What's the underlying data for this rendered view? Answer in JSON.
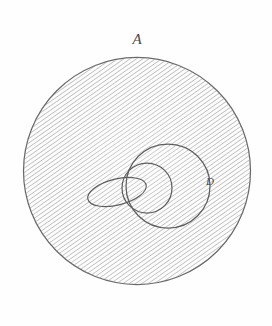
{
  "figure": {
    "background_color": "#fefefe",
    "ink_color": "#5a5a5a",
    "hatch_color": "#9a9a9a",
    "labels": {
      "outer_circle_label": "A",
      "inner_loop_label": "D"
    },
    "outer_circle": {
      "name": "outer-circle",
      "center_x": 137,
      "center_y": 171,
      "radius": 114,
      "fill": "hatched",
      "hatch_angle_deg": 55,
      "hatch_spacing_px": 3
    },
    "shapes": [
      {
        "name": "large-loop",
        "type": "circle",
        "center_x": 168,
        "center_y": 186,
        "radius": 42
      },
      {
        "name": "small-circle",
        "type": "circle",
        "center_x": 147,
        "center_y": 188,
        "radius": 25
      },
      {
        "name": "left-lobe",
        "type": "ellipse",
        "center_x": 117,
        "center_y": 192,
        "radius_x": 30,
        "radius_y": 13,
        "rotation_deg": -14
      }
    ]
  }
}
